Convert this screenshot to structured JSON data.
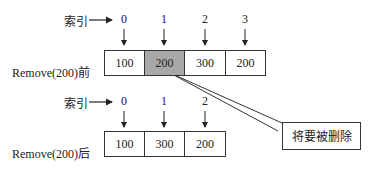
{
  "before": {
    "index_label": "索引",
    "row_label": "Remove(200)前",
    "indices": [
      "0",
      "1",
      "2",
      "3"
    ],
    "cells": [
      "100",
      "200",
      "300",
      "200"
    ],
    "highlighted_index": 1
  },
  "after": {
    "index_label": "索引",
    "row_label": "Remove(200)后",
    "indices": [
      "0",
      "1",
      "2"
    ],
    "cells": [
      "100",
      "300",
      "200"
    ]
  },
  "callout": {
    "text": "将要被删除"
  },
  "colors": {
    "highlight": "#a8a8a8",
    "stroke": "#333333"
  }
}
